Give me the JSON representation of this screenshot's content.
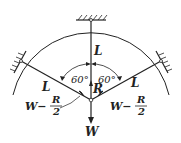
{
  "diagram": {
    "type": "force-diagram",
    "labels": {
      "length_top": "L",
      "length_left": "L",
      "length_right": "L",
      "angle_left": "60°",
      "angle_right": "60°",
      "reaction": "R",
      "weight": "W",
      "tension_left_num": "W−",
      "tension_left_frac_num": "R",
      "tension_left_frac_den": "2",
      "tension_right_num": "W−",
      "tension_right_frac_num": "R",
      "tension_right_frac_den": "2"
    },
    "colors": {
      "line": "#222222",
      "background": "#ffffff"
    }
  }
}
